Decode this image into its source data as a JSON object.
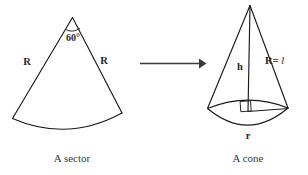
{
  "figure": {
    "background_color": "#ffffff",
    "stroke_color": "#1a1a1a"
  },
  "sector": {
    "caption": "A sector",
    "angle_label": "60°",
    "angle_value": 60,
    "radius_label_left": "R",
    "radius_label_right": "R",
    "apex": {
      "x": 72,
      "y": 17
    },
    "arc_left_end": {
      "x": 12,
      "y": 118
    },
    "arc_right_end": {
      "x": 122,
      "y": 113
    },
    "arc_bottom_depth": 130
  },
  "arrow": {
    "name": "transforms-into-arrow",
    "direction": "right",
    "x_start": 140,
    "x_end": 205,
    "y": 63,
    "color": "#3a3a3a"
  },
  "cone": {
    "caption": "A cone",
    "height_label": "h",
    "slant_label_prefix": "R=",
    "slant_label_variable": "l",
    "slant_label_full": "R= l",
    "radius_label": "r",
    "right_angle_marker": true,
    "apex": {
      "x": 250,
      "y": 5
    },
    "base_center": {
      "x": 248,
      "y": 108
    },
    "base_left": {
      "x": 207,
      "y": 108
    },
    "base_right": {
      "x": 288,
      "y": 108
    },
    "base_bottom_depth": 130
  }
}
